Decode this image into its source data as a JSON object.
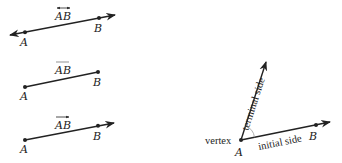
{
  "figures": [
    {
      "id": "line",
      "name": "Line AB",
      "notation": "AB",
      "notation_mark": "double-arrow-overbar",
      "points": [
        {
          "label": "A"
        },
        {
          "label": "B"
        }
      ]
    },
    {
      "id": "segment",
      "name": "Line segment AB",
      "notation": "AB",
      "notation_mark": "overbar",
      "points": [
        {
          "label": "A"
        },
        {
          "label": "B"
        }
      ]
    },
    {
      "id": "ray",
      "name": "Ray AB",
      "notation": "AB",
      "notation_mark": "right-arrow-overbar",
      "points": [
        {
          "label": "A"
        },
        {
          "label": "B"
        }
      ]
    },
    {
      "id": "angle",
      "name": "Angle",
      "labels": {
        "vertex": "vertex",
        "vertex_point": "A",
        "terminal": "terminal side",
        "initial": "initial side",
        "point_b": "B"
      }
    }
  ],
  "colors": {
    "ink": "#222222",
    "arc": "#9a9a9a",
    "background": "#ffffff"
  }
}
